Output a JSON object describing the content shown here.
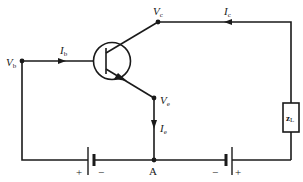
{
  "diagram": {
    "type": "transistor-circuit",
    "nodes": {
      "base": {
        "label": "V",
        "sub": "b"
      },
      "collector": {
        "label": "V",
        "sub": "c"
      },
      "emitter": {
        "label": "V",
        "sub": "e"
      },
      "ground": {
        "label": "A"
      }
    },
    "currents": {
      "base": {
        "label": "I",
        "sub": "b"
      },
      "collector": {
        "label": "I",
        "sub": "c"
      },
      "emitter": {
        "label": "I",
        "sub": "e"
      }
    },
    "load": {
      "label": "z",
      "sub": "L"
    },
    "batteries": {
      "left": {
        "plus": "+",
        "minus": "−"
      },
      "right": {
        "plus": "+",
        "minus": "−"
      }
    },
    "colors": {
      "line": "#1a1a1a",
      "background": "#ffffff"
    }
  }
}
